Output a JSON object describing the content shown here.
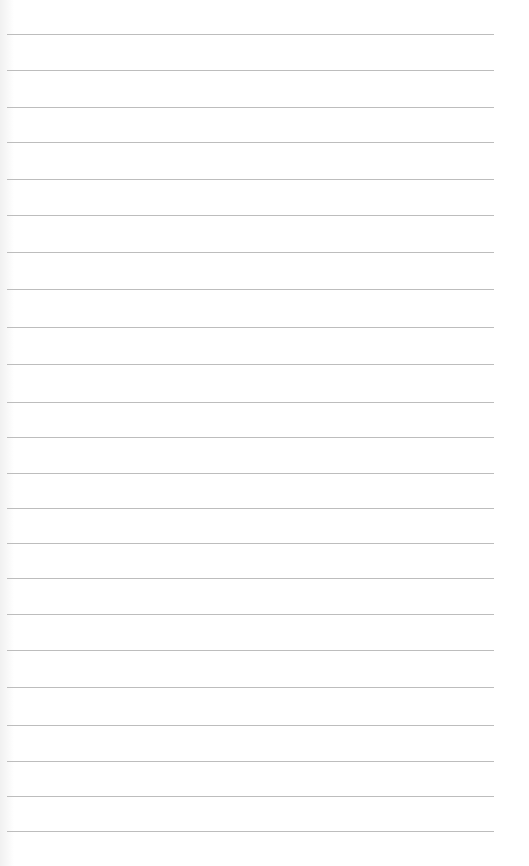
{
  "page": {
    "type": "lined-paper",
    "background_color": "#ffffff",
    "line_color": "#bdbdbd",
    "line_count": 23,
    "line_left": 7,
    "line_right": 494,
    "line_positions_y": [
      34,
      70,
      107,
      142,
      179,
      215,
      252,
      289,
      327,
      364,
      402,
      437,
      473,
      508,
      543,
      578,
      614,
      650,
      687,
      725,
      761,
      796,
      831
    ]
  }
}
